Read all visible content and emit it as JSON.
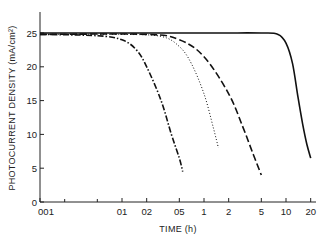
{
  "chart_data": {
    "type": "line",
    "title": "",
    "xlabel": "TIME (h)",
    "ylabel": "PHOTOCURRENT DENSITY (mA/cm²)",
    "xscale": "log",
    "xlim": [
      0.01,
      20
    ],
    "ylim": [
      0,
      27
    ],
    "x_ticks": [
      0.01,
      0.1,
      0.2,
      0.5,
      1,
      2,
      5,
      10,
      20
    ],
    "x_tick_labels": [
      "001",
      "01",
      "02",
      "05",
      "1",
      "2",
      "5",
      "10",
      "20"
    ],
    "x_minor_ticks": [
      0.02,
      0.05
    ],
    "y_ticks": [
      0,
      5,
      10,
      15,
      20,
      25
    ],
    "y_tick_labels": [
      "0",
      "5",
      "10",
      "15",
      "20",
      "25"
    ],
    "grid": false,
    "legend": null,
    "series": [
      {
        "name": "dash-dot curve",
        "style": "dashdot",
        "x": [
          0.01,
          0.05,
          0.1,
          0.15,
          0.2,
          0.3,
          0.4,
          0.5,
          0.55
        ],
        "y": [
          24.8,
          24.6,
          24.0,
          22.5,
          20.0,
          15.0,
          10.0,
          6.5,
          4.5
        ]
      },
      {
        "name": "dotted curve",
        "style": "dotted",
        "x": [
          0.01,
          0.1,
          0.3,
          0.5,
          0.7,
          1.0,
          1.3,
          1.5
        ],
        "y": [
          24.8,
          24.8,
          24.5,
          23.0,
          20.5,
          16.0,
          11.0,
          8.0
        ]
      },
      {
        "name": "dashed curve",
        "style": "dashed",
        "x": [
          0.01,
          0.2,
          0.5,
          1.0,
          2.0,
          3.0,
          4.0,
          5.0
        ],
        "y": [
          24.8,
          24.8,
          24.0,
          21.5,
          16.0,
          11.0,
          7.0,
          4.0
        ]
      },
      {
        "name": "solid curve",
        "style": "solid",
        "x": [
          0.01,
          1,
          5,
          8,
          10,
          12,
          14,
          16,
          18,
          20
        ],
        "y": [
          25.0,
          25.0,
          25.0,
          24.8,
          23.5,
          20.5,
          15.5,
          11.5,
          8.5,
          6.5
        ]
      }
    ]
  }
}
